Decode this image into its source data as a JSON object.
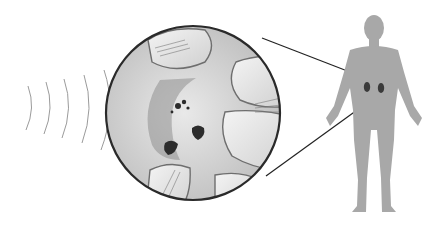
{
  "illustration": {
    "subject": "kidney-stone-lithotripsy",
    "elements": {
      "shockwaves": {
        "count": 7,
        "color": "#8a8a8a"
      },
      "magnified_view": {
        "center": [
          193,
          113
        ],
        "radius": 88,
        "border_color": "#2a2a2a"
      },
      "human_figure": {
        "fill": "#a9a9a9"
      },
      "kidneys": {
        "color": "#3a3a3a"
      },
      "callout_lines": {
        "color": "#222222"
      }
    }
  }
}
